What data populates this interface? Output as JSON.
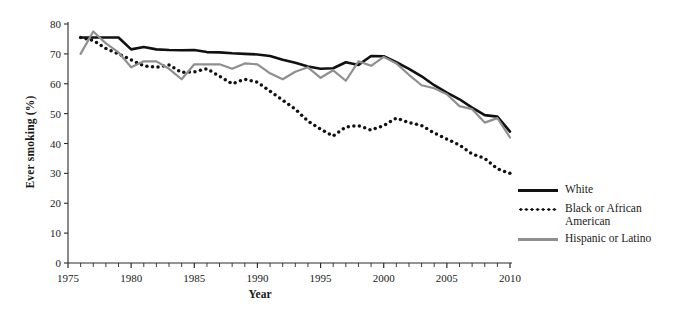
{
  "chart_data": {
    "type": "line",
    "title": "",
    "xlabel": "Year",
    "ylabel": "Ever smoking (%)",
    "xlim": [
      1975,
      2010
    ],
    "ylim": [
      0,
      80
    ],
    "ytick_labels": [
      "0",
      "10",
      "20",
      "30",
      "40",
      "50",
      "60",
      "70",
      "80"
    ],
    "ytick_values": [
      0,
      10,
      20,
      30,
      40,
      50,
      60,
      70,
      80
    ],
    "xtick_labels": [
      "1975",
      "1980",
      "1985",
      "1990",
      "1995",
      "2000",
      "2005",
      "2010"
    ],
    "xtick_values": [
      1975,
      1980,
      1985,
      1990,
      1995,
      2000,
      2005,
      2010
    ],
    "minor_xticks_every": 1,
    "grid": false,
    "legend_position": "right",
    "x": [
      1976,
      1977,
      1978,
      1979,
      1980,
      1981,
      1982,
      1983,
      1984,
      1985,
      1986,
      1987,
      1988,
      1989,
      1990,
      1991,
      1992,
      1993,
      1994,
      1995,
      1996,
      1997,
      1998,
      1999,
      2000,
      2001,
      2002,
      2003,
      2004,
      2005,
      2006,
      2007,
      2008,
      2009,
      2010
    ],
    "series": [
      {
        "name": "White",
        "color": "#111111",
        "style": "solid",
        "values": [
          75.5,
          75.5,
          75.5,
          75.5,
          71.5,
          72.3,
          71.5,
          71.3,
          71.2,
          71.3,
          70.6,
          70.5,
          70.2,
          70.0,
          69.8,
          69.3,
          68.0,
          67.0,
          65.8,
          65.0,
          65.2,
          67.2,
          66.3,
          69.3,
          69.2,
          67.2,
          65.0,
          62.5,
          59.5,
          57.0,
          54.8,
          52.0,
          49.5,
          49.0,
          44.0
        ]
      },
      {
        "name": "Black or African American",
        "color": "#111111",
        "style": "dotted",
        "values": [
          75.5,
          74.5,
          71.8,
          70.0,
          68.0,
          66.0,
          65.5,
          66.3,
          63.8,
          64.0,
          65.0,
          62.5,
          60.0,
          61.5,
          60.5,
          57.5,
          54.5,
          51.5,
          47.5,
          44.8,
          42.5,
          45.5,
          46.0,
          44.5,
          46.0,
          48.5,
          47.0,
          46.0,
          43.5,
          41.5,
          39.5,
          36.5,
          35.0,
          31.5,
          30.0
        ]
      },
      {
        "name": "Hispanic or Latino",
        "color": "#8f8f8f",
        "style": "solid",
        "values": [
          70.0,
          77.5,
          73.5,
          70.5,
          65.5,
          67.5,
          67.5,
          65.0,
          61.5,
          66.5,
          66.5,
          66.5,
          65.0,
          66.8,
          66.5,
          63.5,
          61.5,
          64.0,
          65.5,
          62.0,
          64.5,
          61.0,
          67.5,
          66.0,
          69.0,
          66.8,
          63.0,
          59.5,
          58.5,
          56.5,
          52.5,
          51.5,
          47.0,
          48.5,
          42.0
        ]
      }
    ]
  },
  "legend": {
    "entries": [
      {
        "label": "White",
        "swatch": "solid-black"
      },
      {
        "label": "Black or African\nAmerican",
        "swatch": "dotted-black"
      },
      {
        "label": "Hispanic or Latino",
        "swatch": "solid-gray"
      }
    ],
    "entry_0_label": "White",
    "entry_1_label_line1": "Black or African",
    "entry_1_label_line2": "American",
    "entry_2_label": "Hispanic or Latino"
  },
  "axes": {
    "y_title": "Ever smoking (%)",
    "x_title": "Year"
  }
}
